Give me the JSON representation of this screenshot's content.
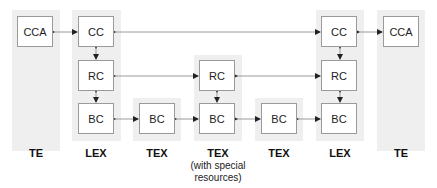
{
  "diagram": {
    "columns": [
      {
        "id": "te-left",
        "label": "TE",
        "nodes": [
          "CCA"
        ]
      },
      {
        "id": "lex-left",
        "label": "LEX",
        "nodes": [
          "CC",
          "RC",
          "BC"
        ]
      },
      {
        "id": "tex-1",
        "label": "TEX",
        "nodes": [
          "BC"
        ]
      },
      {
        "id": "tex-special",
        "label": "TEX",
        "sublabel_1": "(with special",
        "sublabel_2": "resources)",
        "nodes": [
          "RC",
          "BC"
        ]
      },
      {
        "id": "tex-2",
        "label": "TEX",
        "nodes": [
          "BC"
        ]
      },
      {
        "id": "lex-right",
        "label": "LEX",
        "nodes": [
          "CC",
          "RC",
          "BC"
        ]
      },
      {
        "id": "te-right",
        "label": "TE",
        "nodes": [
          "CCA"
        ]
      }
    ],
    "edges": [
      [
        "te-left.CCA",
        "lex-left.CC"
      ],
      [
        "lex-left.CC",
        "lex-right.CC"
      ],
      [
        "lex-right.CC",
        "te-right.CCA"
      ],
      [
        "lex-left.CC",
        "lex-left.RC"
      ],
      [
        "lex-left.RC",
        "lex-left.BC"
      ],
      [
        "lex-left.RC",
        "tex-special.RC"
      ],
      [
        "tex-special.RC",
        "lex-right.RC"
      ],
      [
        "lex-left.BC",
        "tex-1.BC"
      ],
      [
        "tex-1.BC",
        "tex-special.BC"
      ],
      [
        "tex-special.BC",
        "tex-2.BC"
      ],
      [
        "tex-2.BC",
        "lex-right.BC"
      ],
      [
        "tex-special.RC",
        "tex-special.BC"
      ],
      [
        "lex-right.CC",
        "lex-right.RC"
      ],
      [
        "lex-right.RC",
        "lex-right.BC"
      ]
    ],
    "colors": {
      "column_bg": "#efefef",
      "box_border": "#9a9a9a",
      "line": "#9a9a9a",
      "arrow": "#222222"
    }
  }
}
